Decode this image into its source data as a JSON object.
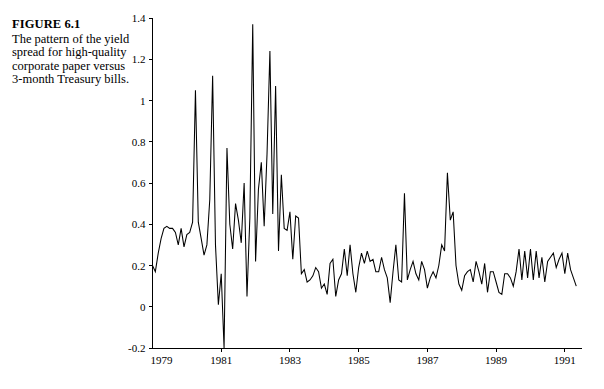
{
  "figure": {
    "label": "FIGURE 6.1",
    "caption": "The pattern of the yield spread for high-quality corporate paper versus 3-month Treasury bills."
  },
  "chart_data": {
    "type": "line",
    "title": "",
    "subtitle": "",
    "xlabel": "",
    "ylabel": "",
    "xlim": [
      1979.0,
      1991.5
    ],
    "ylim": [
      -0.2,
      1.4
    ],
    "grid": false,
    "legend": null,
    "line_color": "#000000",
    "background_color": "#ffffff",
    "xticks": [
      1979,
      1981,
      1983,
      1985,
      1987,
      1989,
      1991
    ],
    "xtick_labels": [
      "1979",
      "1981",
      "1983",
      "1985",
      "1987",
      "1989",
      "1991"
    ],
    "yticks": [
      -0.2,
      0,
      0.2,
      0.4,
      0.6,
      0.8,
      1.0,
      1.2,
      1.4
    ],
    "ytick_labels": [
      "-0.2",
      "0",
      "0.2",
      "0.4",
      "0.6",
      "0.8",
      "1",
      "1.2",
      "1.4"
    ],
    "series": [
      {
        "name": "yield spread",
        "x": [
          1979.0,
          1979.083,
          1979.167,
          1979.25,
          1979.333,
          1979.417,
          1979.5,
          1979.583,
          1979.667,
          1979.75,
          1979.833,
          1979.917,
          1980.0,
          1980.083,
          1980.167,
          1980.25,
          1980.333,
          1980.417,
          1980.5,
          1980.583,
          1980.667,
          1980.75,
          1980.833,
          1980.917,
          1981.0,
          1981.083,
          1981.167,
          1981.25,
          1981.333,
          1981.417,
          1981.5,
          1981.583,
          1981.667,
          1981.75,
          1981.833,
          1981.917,
          1982.0,
          1982.083,
          1982.167,
          1982.25,
          1982.333,
          1982.417,
          1982.5,
          1982.583,
          1982.667,
          1982.75,
          1982.833,
          1982.917,
          1983.0,
          1983.083,
          1983.167,
          1983.25,
          1983.333,
          1983.417,
          1983.5,
          1983.583,
          1983.667,
          1983.75,
          1983.833,
          1983.917,
          1984.0,
          1984.083,
          1984.167,
          1984.25,
          1984.333,
          1984.417,
          1984.5,
          1984.583,
          1984.667,
          1984.75,
          1984.833,
          1984.917,
          1985.0,
          1985.083,
          1985.167,
          1985.25,
          1985.333,
          1985.417,
          1985.5,
          1985.583,
          1985.667,
          1985.75,
          1985.833,
          1985.917,
          1986.0,
          1986.083,
          1986.167,
          1986.25,
          1986.333,
          1986.417,
          1986.5,
          1986.583,
          1986.667,
          1986.75,
          1986.833,
          1986.917,
          1987.0,
          1987.083,
          1987.167,
          1987.25,
          1987.333,
          1987.417,
          1987.5,
          1987.583,
          1987.667,
          1987.75,
          1987.833,
          1987.917,
          1988.0,
          1988.083,
          1988.167,
          1988.25,
          1988.333,
          1988.417,
          1988.5,
          1988.583,
          1988.667,
          1988.75,
          1988.833,
          1988.917,
          1989.0,
          1989.083,
          1989.167,
          1989.25,
          1989.333,
          1989.417,
          1989.5,
          1989.583,
          1989.667,
          1989.75,
          1989.833,
          1989.917,
          1990.0,
          1990.083,
          1990.167,
          1990.25,
          1990.333,
          1990.417,
          1990.5,
          1990.583,
          1990.667,
          1990.75,
          1990.833,
          1990.917,
          1991.0,
          1991.083,
          1991.167,
          1991.25,
          1991.333
        ],
        "y": [
          0.2,
          0.17,
          0.26,
          0.33,
          0.38,
          0.39,
          0.38,
          0.38,
          0.36,
          0.3,
          0.38,
          0.29,
          0.35,
          0.36,
          0.41,
          1.05,
          0.41,
          0.33,
          0.25,
          0.3,
          0.52,
          1.12,
          0.3,
          0.01,
          0.16,
          -0.2,
          0.77,
          0.4,
          0.28,
          0.5,
          0.42,
          0.31,
          0.6,
          0.05,
          0.43,
          1.37,
          0.22,
          0.57,
          0.7,
          0.39,
          0.74,
          1.24,
          0.45,
          1.07,
          0.27,
          0.64,
          0.38,
          0.37,
          0.46,
          0.23,
          0.44,
          0.43,
          0.16,
          0.18,
          0.12,
          0.13,
          0.15,
          0.19,
          0.17,
          0.09,
          0.11,
          0.06,
          0.21,
          0.23,
          0.05,
          0.13,
          0.16,
          0.28,
          0.15,
          0.3,
          0.16,
          0.07,
          0.19,
          0.26,
          0.21,
          0.27,
          0.22,
          0.23,
          0.17,
          0.17,
          0.24,
          0.18,
          0.14,
          0.02,
          0.17,
          0.3,
          0.13,
          0.12,
          0.55,
          0.13,
          0.18,
          0.22,
          0.16,
          0.13,
          0.22,
          0.18,
          0.09,
          0.14,
          0.17,
          0.14,
          0.2,
          0.3,
          0.27,
          0.65,
          0.42,
          0.46,
          0.2,
          0.11,
          0.08,
          0.15,
          0.17,
          0.18,
          0.12,
          0.22,
          0.17,
          0.11,
          0.21,
          0.07,
          0.17,
          0.17,
          0.12,
          0.07,
          0.06,
          0.16,
          0.16,
          0.14,
          0.1,
          0.17,
          0.28,
          0.13,
          0.27,
          0.14,
          0.28,
          0.13,
          0.27,
          0.14,
          0.24,
          0.12,
          0.22,
          0.24,
          0.26,
          0.19,
          0.23,
          0.26,
          0.16,
          0.26,
          0.18,
          0.14,
          0.1
        ]
      }
    ]
  }
}
